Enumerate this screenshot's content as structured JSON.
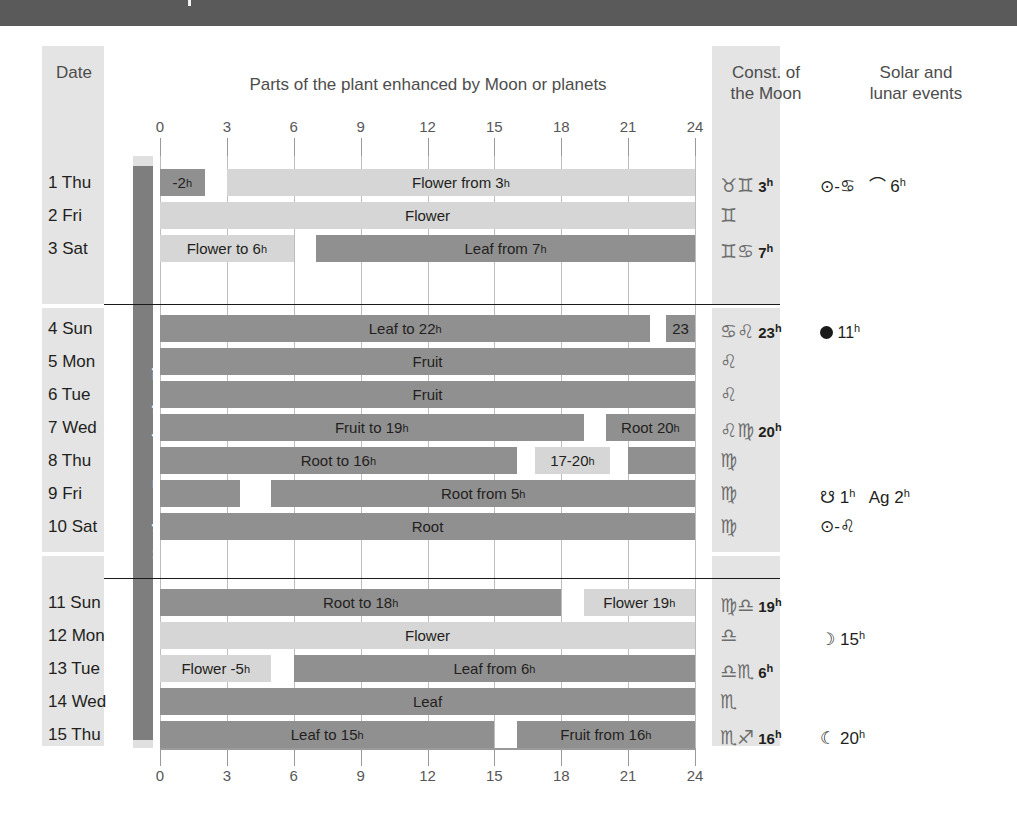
{
  "headers": {
    "date": "Date",
    "parts": "Parts of the plant enhanced by Moon or planets",
    "const_line1": "Const. of",
    "const_line2": "the Moon",
    "events_line1": "Solar and",
    "events_line2": "lunar events"
  },
  "vertical_label": "Northern Transplanting Time",
  "axis": {
    "ticks": [
      0,
      3,
      6,
      9,
      12,
      15,
      18,
      21,
      24
    ],
    "min": 0,
    "max": 24
  },
  "colors": {
    "light_bar": "#d6d6d6",
    "dark_bar": "#909090",
    "band": "#e4e4e4",
    "topbar": "#5a5a5a",
    "vbar": "#7e7e7e",
    "grid": "#bdbdbd"
  },
  "chart_data": {
    "type": "bar",
    "title": "Parts of the plant enhanced by Moon or planets",
    "xlabel": "Hour of day",
    "ylabel": "Date",
    "xlim": [
      0,
      24
    ],
    "grid": true,
    "legend": "none",
    "categories": [
      "1 Thu",
      "2 Fri",
      "3 Sat",
      "4 Sun",
      "5 Mon",
      "6 Tue",
      "7 Wed",
      "8 Thu",
      "9 Fri",
      "10 Sat",
      "11 Sun",
      "12 Mon",
      "13 Tue",
      "14 Wed",
      "15 Thu"
    ],
    "rows": [
      {
        "day": "1 Thu",
        "group": 0,
        "segments": [
          {
            "start": 0,
            "end": 2,
            "tone": "dark",
            "label": "-2",
            "sup": "h"
          },
          {
            "start": 3,
            "end": 24,
            "tone": "light",
            "label": "Flower from 3",
            "sup": "h"
          }
        ]
      },
      {
        "day": "2 Fri",
        "group": 0,
        "segments": [
          {
            "start": 0,
            "end": 24,
            "tone": "light",
            "label": "Flower",
            "sup": ""
          }
        ]
      },
      {
        "day": "3 Sat",
        "group": 0,
        "segments": [
          {
            "start": 0,
            "end": 6,
            "tone": "light",
            "label": "Flower to 6",
            "sup": "h"
          },
          {
            "start": 7,
            "end": 24,
            "tone": "dark",
            "label": "Leaf from 7",
            "sup": "h"
          }
        ]
      },
      {
        "day": "4 Sun",
        "group": 1,
        "segments": [
          {
            "start": 0,
            "end": 22,
            "tone": "dark",
            "label": "Leaf to 22",
            "sup": "h"
          },
          {
            "start": 22.7,
            "end": 24,
            "tone": "dark",
            "label": "23",
            "sup": ""
          }
        ]
      },
      {
        "day": "5 Mon",
        "group": 1,
        "segments": [
          {
            "start": 0,
            "end": 24,
            "tone": "dark",
            "label": "Fruit",
            "sup": ""
          }
        ]
      },
      {
        "day": "6 Tue",
        "group": 1,
        "segments": [
          {
            "start": 0,
            "end": 24,
            "tone": "dark",
            "label": "Fruit",
            "sup": ""
          }
        ]
      },
      {
        "day": "7 Wed",
        "group": 1,
        "segments": [
          {
            "start": 0,
            "end": 19,
            "tone": "dark",
            "label": "Fruit to 19",
            "sup": "h"
          },
          {
            "start": 20,
            "end": 24,
            "tone": "dark",
            "label": "Root 20",
            "sup": "h"
          }
        ]
      },
      {
        "day": "8 Thu",
        "group": 1,
        "segments": [
          {
            "start": 0,
            "end": 16,
            "tone": "dark",
            "label": "Root to 16",
            "sup": "h"
          },
          {
            "start": 16.8,
            "end": 20.2,
            "tone": "light",
            "label": "17-20",
            "sup": "h"
          },
          {
            "start": 21,
            "end": 24,
            "tone": "dark",
            "label": "",
            "sup": ""
          }
        ]
      },
      {
        "day": "9 Fri",
        "group": 1,
        "segments": [
          {
            "start": 0,
            "end": 3.6,
            "tone": "dark",
            "label": "",
            "sup": ""
          },
          {
            "start": 5,
            "end": 24,
            "tone": "dark",
            "label": "Root from 5",
            "sup": "h"
          }
        ]
      },
      {
        "day": "10 Sat",
        "group": 1,
        "segments": [
          {
            "start": 0,
            "end": 24,
            "tone": "dark",
            "label": "Root",
            "sup": ""
          }
        ]
      },
      {
        "day": "11 Sun",
        "group": 2,
        "segments": [
          {
            "start": 0,
            "end": 18,
            "tone": "dark",
            "label": "Root to 18",
            "sup": "h"
          },
          {
            "start": 19,
            "end": 24,
            "tone": "light",
            "label": "Flower 19",
            "sup": "h"
          }
        ]
      },
      {
        "day": "12 Mon",
        "group": 2,
        "segments": [
          {
            "start": 0,
            "end": 24,
            "tone": "light",
            "label": "Flower",
            "sup": ""
          }
        ]
      },
      {
        "day": "13 Tue",
        "group": 2,
        "segments": [
          {
            "start": 0,
            "end": 5,
            "tone": "light",
            "label": "Flower -5",
            "sup": "h"
          },
          {
            "start": 6,
            "end": 24,
            "tone": "dark",
            "label": "Leaf from 6",
            "sup": "h"
          }
        ]
      },
      {
        "day": "14 Wed",
        "group": 2,
        "segments": [
          {
            "start": 0,
            "end": 24,
            "tone": "dark",
            "label": "Leaf",
            "sup": ""
          }
        ]
      },
      {
        "day": "15 Thu",
        "group": 2,
        "segments": [
          {
            "start": 0,
            "end": 15,
            "tone": "dark",
            "label": "Leaf to 15",
            "sup": "h"
          },
          {
            "start": 16,
            "end": 24,
            "tone": "dark",
            "label": "Fruit from 16",
            "sup": "h"
          }
        ]
      }
    ]
  },
  "constellations": [
    {
      "glyphs": "♉♊",
      "hour": "3",
      "sup": "h"
    },
    {
      "glyphs": "♊",
      "hour": "",
      "sup": ""
    },
    {
      "glyphs": "♊♋",
      "hour": "7",
      "sup": "h"
    },
    {
      "glyphs": "♋♌",
      "hour": "23",
      "sup": "h"
    },
    {
      "glyphs": "♌",
      "hour": "",
      "sup": ""
    },
    {
      "glyphs": "♌",
      "hour": "",
      "sup": ""
    },
    {
      "glyphs": "♌♍",
      "hour": "20",
      "sup": "h"
    },
    {
      "glyphs": "♍",
      "hour": "",
      "sup": ""
    },
    {
      "glyphs": "♍",
      "hour": "",
      "sup": ""
    },
    {
      "glyphs": "♍",
      "hour": "",
      "sup": ""
    },
    {
      "glyphs": "♍♎",
      "hour": "19",
      "sup": "h"
    },
    {
      "glyphs": "♎",
      "hour": "",
      "sup": ""
    },
    {
      "glyphs": "♎♏",
      "hour": "6",
      "sup": "h"
    },
    {
      "glyphs": "♏",
      "hour": "",
      "sup": ""
    },
    {
      "glyphs": "♏♐",
      "hour": "16",
      "sup": "h"
    }
  ],
  "events": [
    {
      "text": "⊙-♋",
      "hour": "",
      "sup": "",
      "extra": "⌒ 6",
      "extra_sup": "h",
      "newmoon": false
    },
    {
      "text": "",
      "hour": "",
      "sup": "",
      "extra": "",
      "extra_sup": "",
      "newmoon": false
    },
    {
      "text": "",
      "hour": "",
      "sup": "",
      "extra": "",
      "extra_sup": "",
      "newmoon": false
    },
    {
      "text": "",
      "hour": "11",
      "sup": "h",
      "extra": "",
      "extra_sup": "",
      "newmoon": true
    },
    {
      "text": "",
      "hour": "",
      "sup": "",
      "extra": "",
      "extra_sup": "",
      "newmoon": false
    },
    {
      "text": "",
      "hour": "",
      "sup": "",
      "extra": "",
      "extra_sup": "",
      "newmoon": false
    },
    {
      "text": "",
      "hour": "",
      "sup": "",
      "extra": "",
      "extra_sup": "",
      "newmoon": false
    },
    {
      "text": "",
      "hour": "",
      "sup": "",
      "extra": "",
      "extra_sup": "",
      "newmoon": false
    },
    {
      "text": "☋ 1",
      "hour": "",
      "sup": "h",
      "extra": "Ag 2",
      "extra_sup": "h",
      "newmoon": false
    },
    {
      "text": "⊙-♌",
      "hour": "",
      "sup": "",
      "extra": "",
      "extra_sup": "",
      "newmoon": false
    },
    {
      "text": "",
      "hour": "",
      "sup": "",
      "extra": "",
      "extra_sup": "",
      "newmoon": false
    },
    {
      "text": "☽ 15",
      "hour": "",
      "sup": "h",
      "extra": "",
      "extra_sup": "",
      "newmoon": false
    },
    {
      "text": "",
      "hour": "",
      "sup": "",
      "extra": "",
      "extra_sup": "",
      "newmoon": false
    },
    {
      "text": "",
      "hour": "",
      "sup": "",
      "extra": "",
      "extra_sup": "",
      "newmoon": false
    },
    {
      "text": "☾ 20",
      "hour": "",
      "sup": "h",
      "extra": "",
      "extra_sup": "",
      "newmoon": false
    }
  ]
}
